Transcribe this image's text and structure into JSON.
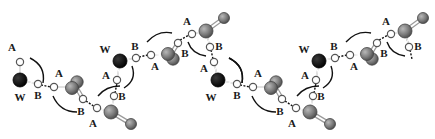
{
  "figure": {
    "labels": {
      "water": "W",
      "acceptor": "A",
      "donor": "B"
    },
    "colors": {
      "water_atom": "#000000",
      "heavy_atom": "#7a7a7a",
      "hydrogen_atom": "#ffffff",
      "line": "#111111"
    },
    "repeat_units": 2
  }
}
